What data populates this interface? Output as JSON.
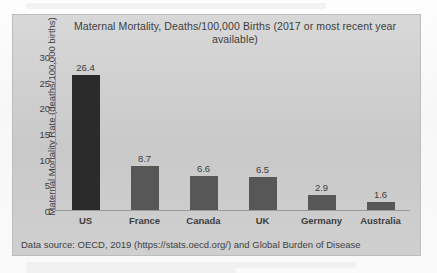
{
  "chart_data": {
    "type": "bar",
    "title": "Maternal Mortality, Deaths/100,000 Births (2017 or most recent year available)",
    "xlabel": "",
    "ylabel": "Maternal Mortality Rate (deaths/100,000 births)",
    "categories": [
      "US",
      "France",
      "Canada",
      "UK",
      "Germany",
      "Australia"
    ],
    "values": [
      26.4,
      8.7,
      6.6,
      6.5,
      2.9,
      1.6
    ],
    "value_labels": [
      "26.4",
      "8.7",
      "6.6",
      "6.5",
      "2.9",
      "1.6"
    ],
    "ylim": [
      0,
      30
    ],
    "yticks": [
      30,
      25,
      20,
      15,
      10,
      5,
      0
    ],
    "ytick_labels": [
      "30",
      "25",
      "20",
      "15",
      "10",
      "5",
      "0"
    ],
    "grid": false,
    "legend": false,
    "bar_color": "#575757",
    "highlight_color": "#2b2b2b",
    "highlight_category": "US",
    "source_note": "Data source: OECD, 2019 (https://stats.oecd.org/) and Global Burden of Disease"
  }
}
